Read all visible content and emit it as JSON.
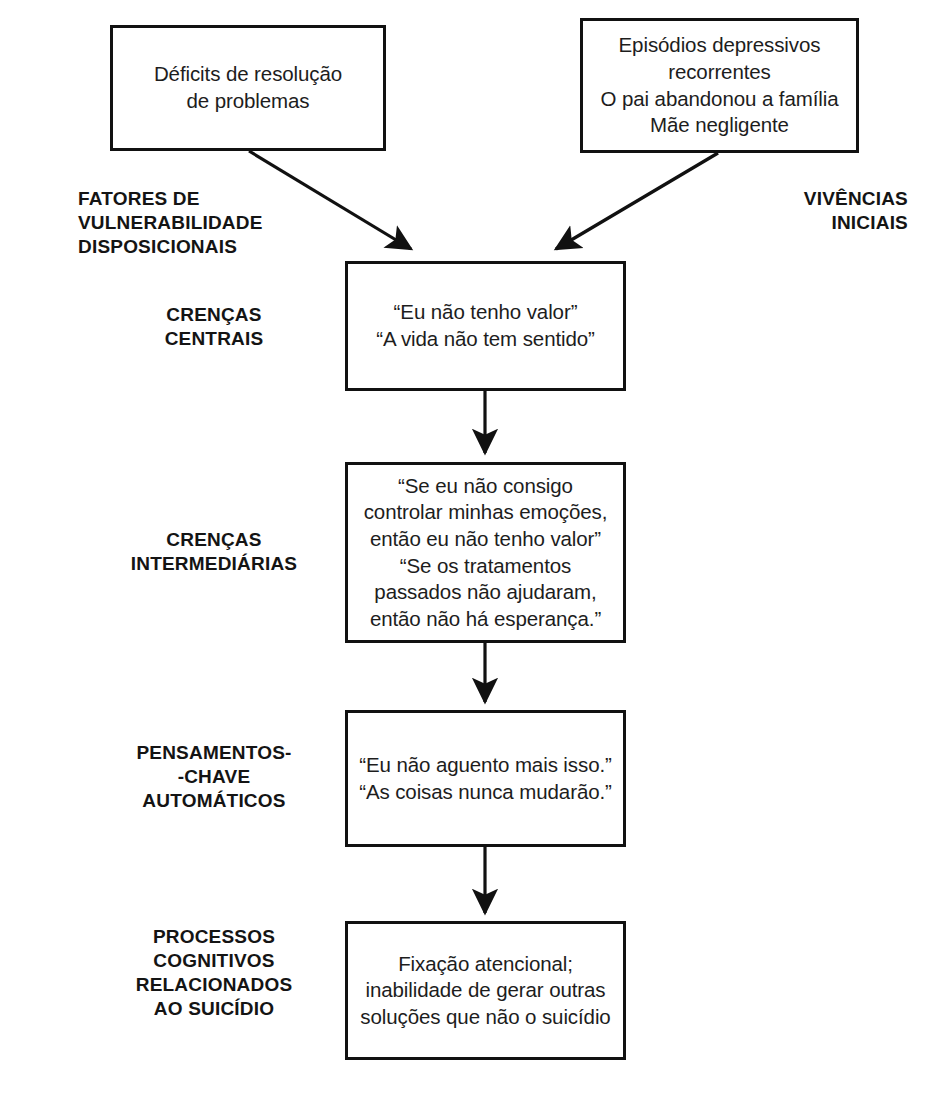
{
  "diagram": {
    "type": "flowchart",
    "background_color": "#ffffff",
    "stroke_color": "#111111",
    "text_color": "#1d1d1d"
  },
  "nodes": {
    "vulnerability": {
      "text": "Déficits de resolução\nde problemas"
    },
    "early_experiences": {
      "text": "Episódios depressivos\nrecorrentes\nO pai abandonou a família\nMãe negligente"
    },
    "core_beliefs": {
      "text": "“Eu não tenho valor”\n“A vida não tem sentido”"
    },
    "intermediate_beliefs": {
      "text": "“Se eu não consigo\ncontrolar minhas emoções,\nentão eu não tenho valor”\n“Se os tratamentos\npassados não ajudaram,\nentão não há esperança.”"
    },
    "automatic_thoughts": {
      "text": "“Eu não aguento mais isso.”\n“As coisas nunca mudarão.”"
    },
    "suicide_processes": {
      "text": "Fixação atencional;\ninabilidade de gerar outras\nsoluções que não o suicídio"
    }
  },
  "labels": {
    "dispositional": "FATORES DE\nVULNERABILIDADE\nDISPOSICIONAIS",
    "early": "VIVÊNCIAS\nINICIAIS",
    "core": "CRENÇAS\nCENTRAIS",
    "intermediate": "CRENÇAS\nINTERMEDIÁRIAS",
    "automatic": "PENSAMENTOS-\n-CHAVE\nAUTOMÁTICOS",
    "processes": "PROCESSOS\nCOGNITIVOS\nRELACIONADOS\nAO SUICÍDIO"
  }
}
